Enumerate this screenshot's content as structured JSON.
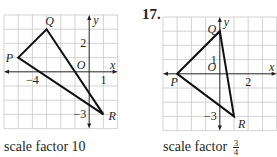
{
  "problems": [
    {
      "number": "",
      "caption_text": "scale factor 10",
      "caption_fraction": null,
      "grid": {
        "left": 4,
        "top": 15,
        "cell": 14.2,
        "cols": 8,
        "rows": 8,
        "xmin": -6,
        "ymax": 4
      },
      "axis_labels": {
        "x": "x",
        "y": "y",
        "origin": "O"
      },
      "tick_labels": [
        {
          "text": "2",
          "x": 0,
          "y": 2,
          "pos": "left"
        },
        {
          "text": "−4",
          "x": -4,
          "y": 0,
          "pos": "below"
        },
        {
          "text": "1",
          "x": 1,
          "y": 0,
          "pos": "below"
        },
        {
          "text": "−3",
          "x": 0,
          "y": -3,
          "pos": "left"
        }
      ],
      "vertices": [
        {
          "label": "P",
          "x": -5,
          "y": 1,
          "pos": "left"
        },
        {
          "label": "Q",
          "x": -3,
          "y": 3,
          "pos": "above"
        },
        {
          "label": "R",
          "x": 1,
          "y": -3,
          "pos": "right"
        }
      ]
    },
    {
      "number": "17.",
      "caption_text": "scale factor ",
      "caption_fraction": {
        "numerator": "3",
        "denominator": "4"
      },
      "grid": {
        "left": 163,
        "top": 17,
        "cell": 14.2,
        "cols": 8,
        "rows": 8,
        "xmin": -4,
        "ymax": 4
      },
      "axis_labels": {
        "x": "x",
        "y": "y",
        "origin": "O"
      },
      "tick_labels": [
        {
          "text": "1",
          "x": 0,
          "y": 1,
          "pos": "left"
        },
        {
          "text": "2",
          "x": 2,
          "y": 0,
          "pos": "below"
        },
        {
          "text": "−3",
          "x": 0,
          "y": -3,
          "pos": "left"
        }
      ],
      "vertices": [
        {
          "label": "P",
          "x": -3,
          "y": 0,
          "pos": "belowleft"
        },
        {
          "label": "Q",
          "x": 0,
          "y": 3,
          "pos": "aboveleft"
        },
        {
          "label": "R",
          "x": 1,
          "y": -3,
          "pos": "belowright"
        }
      ]
    }
  ],
  "colors": {
    "grid": "#c8c8c8",
    "axis": "#231f20",
    "triangle": "#111111",
    "text": "#231f20"
  }
}
